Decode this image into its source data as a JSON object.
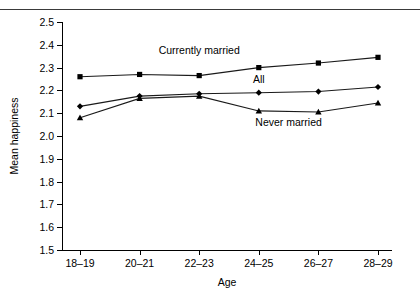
{
  "figure": {
    "clipped_heading": "",
    "top_rule": "horizontal-rule"
  },
  "chart_data": {
    "type": "line",
    "title": "",
    "xlabel": "Age",
    "ylabel": "Mean happiness",
    "categories": [
      "18–19",
      "20–21",
      "22–23",
      "24–25",
      "26–27",
      "28–29"
    ],
    "ylim": [
      1.5,
      2.5
    ],
    "yticks": [
      "1.5",
      "1.6",
      "1.7",
      "1.8",
      "1.9",
      "2.0",
      "2.1",
      "2.2",
      "2.3",
      "2.4",
      "2.5"
    ],
    "ytick_values": [
      1.5,
      1.6,
      1.7,
      1.8,
      1.9,
      2.0,
      2.1,
      2.2,
      2.3,
      2.4,
      2.5
    ],
    "grid": false,
    "legend_position": "inline-annotations",
    "series": [
      {
        "name": "Currently married",
        "marker": "square",
        "values": [
          2.26,
          2.27,
          2.265,
          2.3,
          2.32,
          2.345
        ]
      },
      {
        "name": "All",
        "marker": "diamond",
        "values": [
          2.13,
          2.175,
          2.185,
          2.19,
          2.195,
          2.215
        ]
      },
      {
        "name": "Never married",
        "marker": "triangle",
        "values": [
          2.08,
          2.165,
          2.175,
          2.11,
          2.105,
          2.145
        ]
      }
    ],
    "annotations": [
      {
        "text": "Currently married",
        "x_category": "22–23",
        "y": 2.375
      },
      {
        "text": "All",
        "x_category": "24–25",
        "y": 2.245
      },
      {
        "text": "Never married",
        "x_category": "25–26",
        "y": 2.055
      }
    ]
  }
}
